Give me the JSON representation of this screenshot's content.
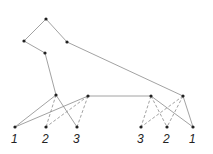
{
  "diagram": {
    "type": "tree",
    "nodes": [
      {
        "id": "top",
        "x": 46,
        "y": 19
      },
      {
        "id": "left",
        "x": 24,
        "y": 41
      },
      {
        "id": "upper-right",
        "x": 67,
        "y": 42
      },
      {
        "id": "mid",
        "x": 45,
        "y": 53
      },
      {
        "id": "hub-a",
        "x": 56,
        "y": 95
      },
      {
        "id": "hub-b",
        "x": 88,
        "y": 96
      },
      {
        "id": "hub-c",
        "x": 151,
        "y": 96
      },
      {
        "id": "hub-d",
        "x": 183,
        "y": 96
      },
      {
        "id": "leaf-l1",
        "x": 15,
        "y": 127
      },
      {
        "id": "leaf-l2",
        "x": 46,
        "y": 127
      },
      {
        "id": "leaf-l3",
        "x": 77,
        "y": 127
      },
      {
        "id": "leaf-r3",
        "x": 141,
        "y": 127
      },
      {
        "id": "leaf-r2",
        "x": 167,
        "y": 127
      },
      {
        "id": "leaf-r1",
        "x": 193,
        "y": 127
      }
    ],
    "edges": [
      {
        "from": "top",
        "to": "left",
        "style": "solid"
      },
      {
        "from": "top",
        "to": "upper-right",
        "style": "solid"
      },
      {
        "from": "left",
        "to": "mid",
        "style": "solid"
      },
      {
        "from": "mid",
        "to": "hub-a",
        "style": "solid"
      },
      {
        "from": "upper-right",
        "to": "hub-d",
        "style": "solid"
      },
      {
        "from": "hub-b",
        "to": "hub-c",
        "style": "solid"
      },
      {
        "from": "hub-a",
        "to": "leaf-l1",
        "style": "solid"
      },
      {
        "from": "hub-a",
        "to": "leaf-l2",
        "style": "dashed"
      },
      {
        "from": "hub-a",
        "to": "leaf-l3",
        "style": "solid"
      },
      {
        "from": "hub-b",
        "to": "leaf-l1",
        "style": "solid"
      },
      {
        "from": "hub-b",
        "to": "leaf-l2",
        "style": "dashed"
      },
      {
        "from": "hub-b",
        "to": "leaf-l3",
        "style": "dashed"
      },
      {
        "from": "hub-c",
        "to": "leaf-r3",
        "style": "dashed"
      },
      {
        "from": "hub-c",
        "to": "leaf-r2",
        "style": "dashed"
      },
      {
        "from": "hub-c",
        "to": "leaf-r1",
        "style": "solid"
      },
      {
        "from": "hub-d",
        "to": "leaf-r3",
        "style": "dashed"
      },
      {
        "from": "hub-d",
        "to": "leaf-r2",
        "style": "dashed"
      },
      {
        "from": "hub-d",
        "to": "leaf-r1",
        "style": "solid"
      }
    ],
    "leaf_labels": [
      {
        "text": "1",
        "x": 11,
        "y": 143
      },
      {
        "text": "2",
        "x": 42,
        "y": 143
      },
      {
        "text": "3",
        "x": 73,
        "y": 143
      },
      {
        "text": "3",
        "x": 137,
        "y": 143
      },
      {
        "text": "2",
        "x": 163,
        "y": 143
      },
      {
        "text": "1",
        "x": 189,
        "y": 143
      }
    ],
    "colors": {
      "edge": "#8a8a8a",
      "node": "#222222",
      "label": "#222222"
    }
  }
}
